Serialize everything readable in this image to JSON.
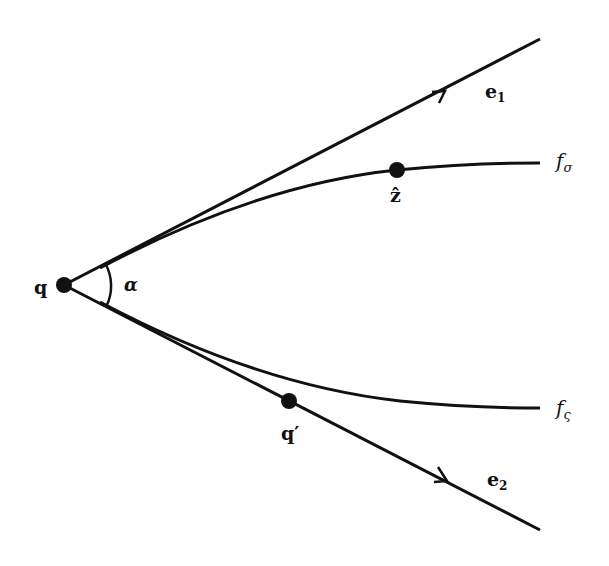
{
  "figure": {
    "type": "geometric-diagram",
    "points": {
      "q": {
        "label": "q",
        "x": 64,
        "y": 285
      },
      "z_hat": {
        "label": "ẑ",
        "x": 397,
        "y": 170
      },
      "q_prime": {
        "label": "q′",
        "x": 289,
        "y": 401
      }
    },
    "rays": [
      {
        "id": "e1",
        "label": "e",
        "subscript": "1",
        "from": [
          64,
          285
        ],
        "to": [
          540,
          38
        ]
      },
      {
        "id": "e2",
        "label": "e",
        "subscript": "2",
        "from": [
          64,
          285
        ],
        "to": [
          540,
          530
        ]
      }
    ],
    "curves": [
      {
        "id": "f_sigma",
        "label": "f",
        "subscript": "σ"
      },
      {
        "id": "f_varsigma",
        "label": "f",
        "subscript": "ς"
      }
    ],
    "angle": {
      "label": "α"
    },
    "colors": {
      "stroke": "#111111",
      "background": "#ffffff"
    }
  }
}
